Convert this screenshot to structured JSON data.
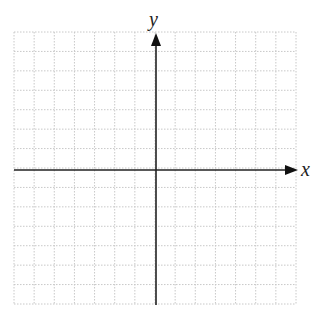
{
  "chart_data": {
    "type": "diagram",
    "title": "",
    "xlabel": "x",
    "ylabel": "y",
    "grid": true,
    "grid_style": "dotted",
    "grid_cells": {
      "columns": 14,
      "rows": 14
    },
    "xlim": [
      -7,
      7
    ],
    "ylim": [
      -7,
      7
    ],
    "tick_labels": false,
    "series": []
  },
  "axes": {
    "x_label": "x",
    "y_label": "y"
  },
  "colors": {
    "axis": "#222222",
    "grid": "#c8c8c8",
    "background": "#ffffff"
  }
}
